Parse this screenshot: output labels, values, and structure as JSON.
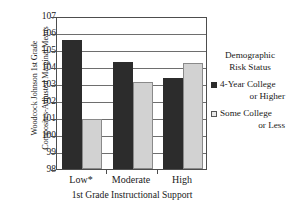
{
  "chart_data": {
    "type": "bar",
    "title": "",
    "xlabel": "1st Grade Instructional Support",
    "ylabel": "Woodcock Johnson 1st Grade Composites-Adjusted Marginal Means",
    "ylabel_lines": [
      "Woodcock Johnson 1st Grade",
      "Composites-Adjusted Marginal Means"
    ],
    "categories": [
      "Low*",
      "Moderate",
      "High"
    ],
    "series": [
      {
        "name": "4-Year College or Higher",
        "values": [
          105.7,
          104.4,
          103.4
        ],
        "color": "#2c2c2c"
      },
      {
        "name": "Some College or Less",
        "values": [
          101.0,
          103.2,
          104.35
        ],
        "color": "#d2d2d2"
      }
    ],
    "ylim": [
      98,
      107
    ],
    "yticks": [
      98,
      99,
      100,
      101,
      102,
      103,
      104,
      105,
      106,
      107
    ],
    "ytick_labels": [
      "98",
      "99",
      "100",
      "101",
      "102",
      "103",
      "104",
      "105",
      "106",
      "107"
    ],
    "grid": true,
    "legend_position": "right"
  },
  "legend": {
    "title_lines": [
      "Demographic",
      "Risk Status"
    ],
    "entries": [
      {
        "line1": "4-Year College",
        "line2": "or Higher",
        "swatch": "dark"
      },
      {
        "line1": "Some College",
        "line2": "or Less",
        "swatch": "light"
      }
    ]
  }
}
